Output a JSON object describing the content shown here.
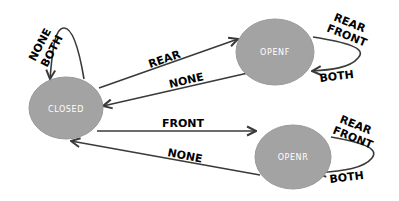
{
  "diagram": {
    "type": "state-machine",
    "colors": {
      "node_fill": "#a3a3a3",
      "node_text": "#ffffff",
      "edge": "#3a3a3a",
      "label": "#000000"
    },
    "nodes": [
      {
        "id": "closed",
        "label": "CLOSED"
      },
      {
        "id": "openf",
        "label": "OPENF"
      },
      {
        "id": "openr",
        "label": "OPENR"
      }
    ],
    "edges": [
      {
        "from": "closed",
        "to": "closed",
        "label_lines": [
          "NONE",
          "BOTH"
        ]
      },
      {
        "from": "closed",
        "to": "openf",
        "label": "REAR"
      },
      {
        "from": "openf",
        "to": "closed",
        "label": "NONE"
      },
      {
        "from": "closed",
        "to": "openr",
        "label": "FRONT"
      },
      {
        "from": "openr",
        "to": "closed",
        "label": "NONE"
      },
      {
        "from": "openf",
        "to": "openf",
        "label_lines": [
          "REAR",
          "FRONT"
        ],
        "arrival_label": "BOTH"
      },
      {
        "from": "openr",
        "to": "openr",
        "label_lines": [
          "REAR",
          "FRONT"
        ],
        "arrival_label": "BOTH"
      }
    ]
  },
  "labels": {
    "closed": "CLOSED",
    "openf": "OPENF",
    "openr": "OPENR",
    "closed_loop_1": "NONE",
    "closed_loop_2": "BOTH",
    "closed_to_openf": "REAR",
    "openf_to_closed": "NONE",
    "closed_to_openr": "FRONT",
    "openr_to_closed": "NONE",
    "openf_loop_1": "REAR",
    "openf_loop_2": "FRONT",
    "openf_loop_3": "BOTH",
    "openr_loop_1": "REAR",
    "openr_loop_2": "FRONT",
    "openr_loop_3": "BOTH"
  }
}
